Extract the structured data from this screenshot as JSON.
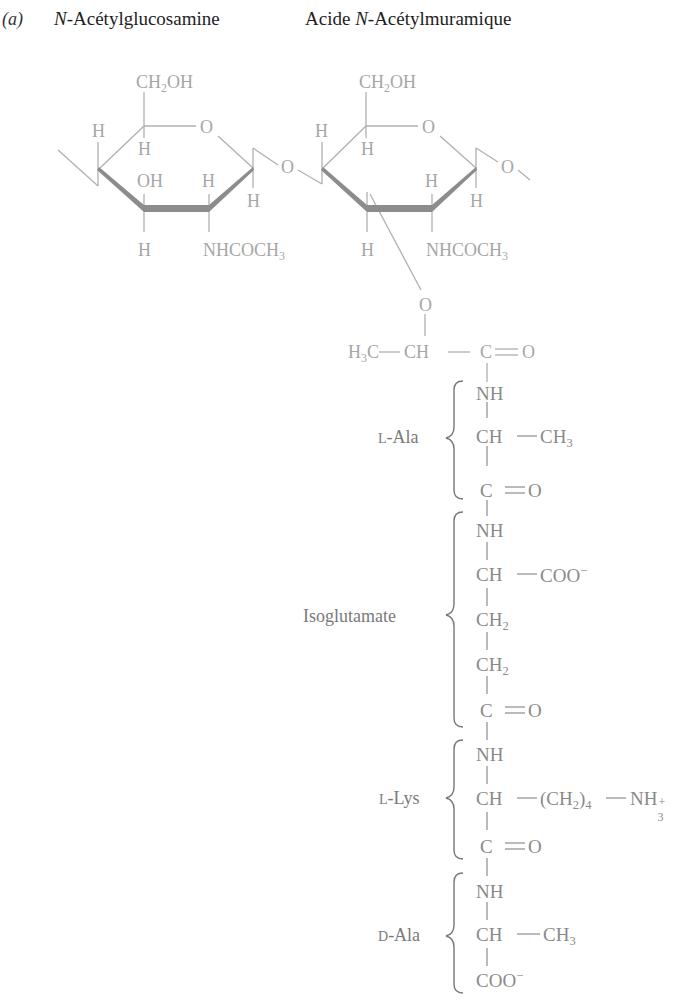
{
  "figure": {
    "panel_label": "(a)",
    "titles": {
      "left_prefix": "N",
      "left_suffix": "-Acétylglucosamine",
      "right_prefix": "Acide ",
      "right_italic": "N",
      "right_suffix": "-Acétylmuramique"
    },
    "colors": {
      "sugar_text": "#a6a6a6",
      "sugar_bonds": "#b0b0b0",
      "ring_bold_edge": "#8c8c8c",
      "chain_text": "#8a8a8a",
      "bracket": "#777777"
    }
  },
  "glcnac": {
    "ch2oh": "CH",
    "ch2oh_sub": "2",
    "ch2oh_tail": "OH",
    "ring_o": "O",
    "c4_h": "H",
    "c5_h": "H",
    "c3_oh": "OH",
    "c2_h_up": "H",
    "c1_h": "H",
    "c3_h_down": "H",
    "c2_nhcoch3": "NHCOCH",
    "c2_nhcoch3_sub": "3",
    "glyco_o": "O"
  },
  "murnac": {
    "ch2oh": "CH",
    "ch2oh_sub": "2",
    "ch2oh_tail": "OH",
    "ring_o": "O",
    "c4_h": "H",
    "c5_h": "H",
    "c2_h_up": "H",
    "c1_h": "H",
    "c3_h_down": "H",
    "c2_nhcoch3": "NHCOCH",
    "c2_nhcoch3_sub": "3",
    "glyco_o": "O",
    "lactyl_o": "O",
    "lactyl_h3c": "H",
    "lactyl_h3c_sub": "3",
    "lactyl_h3c_tail": "C",
    "lactyl_ch": "CH",
    "lactyl_c": "C",
    "lactyl_o2": "O"
  },
  "peptide": [
    {
      "name_prefix": "L",
      "name_suffix": "-Ala",
      "backbone": [
        "NH",
        "CH",
        "C"
      ],
      "side_chain": "CH",
      "side_chain_sub": "3",
      "carbonyl_o": "O"
    },
    {
      "name": "Isoglutamate",
      "backbone": [
        "NH",
        "CH",
        "CH",
        "CH",
        "C"
      ],
      "ch2_sub": "2",
      "side_chain": "COO",
      "side_chain_sup": "−",
      "carbonyl_o": "O"
    },
    {
      "name_prefix": "L",
      "name_suffix": "-Lys",
      "backbone": [
        "NH",
        "CH",
        "C"
      ],
      "side_chain_open": "(CH",
      "side_chain_sub1": "2",
      "side_chain_close": ")",
      "side_chain_sub2": "4",
      "side_chain_end": "NH",
      "side_chain_end_sub": "3",
      "side_chain_end_sup": "+",
      "carbonyl_o": "O"
    },
    {
      "name_prefix": "D",
      "name_suffix": "-Ala",
      "backbone": [
        "NH",
        "CH"
      ],
      "side_chain": "CH",
      "side_chain_sub": "3",
      "terminal": "COO",
      "terminal_sup": "−"
    }
  ]
}
